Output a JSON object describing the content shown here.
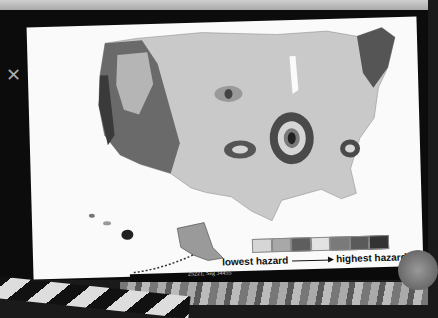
{
  "map": {
    "title": "Seismic hazard map of the United States",
    "regions": [
      "contiguous-us",
      "alaska",
      "hawaii"
    ],
    "shading": "grayscale"
  },
  "legend": {
    "swatches": [
      "#d6d6d6",
      "#a8a8a8",
      "#5e5e5e",
      "#e2e2e2",
      "#7a7a7a",
      "#5a5a5a",
      "#333333"
    ],
    "low_label": "lowest hazard",
    "high_label": "highest hazard"
  },
  "caption": {
    "text": "25221, Seg 34455"
  }
}
